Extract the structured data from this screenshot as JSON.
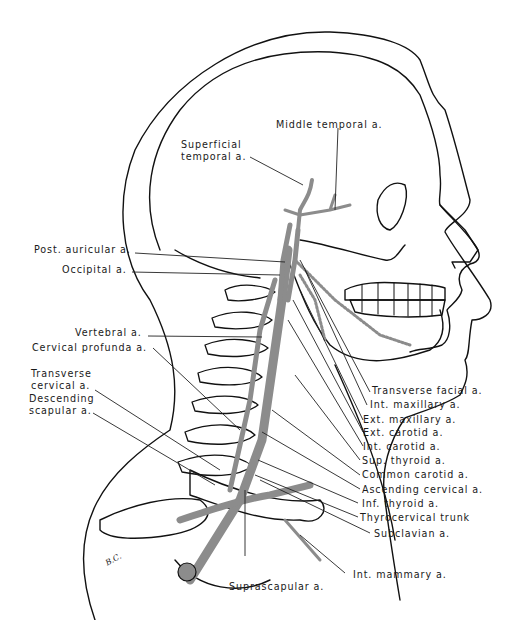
{
  "figure": {
    "artist_initials": "B.C.",
    "colors": {
      "outline": "#111111",
      "artery": "#8c8c8c",
      "leader_line": "#222222",
      "background": "#ffffff"
    }
  },
  "labels": {
    "middle_temporal": "Middle temporal a.",
    "superficial_temporal_1": "Superficial",
    "superficial_temporal_2": "temporal a.",
    "post_auricular": "Post. auricular a.",
    "occipital": "Occipital a.",
    "vertebral": "Vertebral a.",
    "cervical_profunda": "Cervical profunda a.",
    "transverse_cervical_1": "Transverse",
    "transverse_cervical_2": "cervical a.",
    "descending_scapular_1": "Descending",
    "descending_scapular_2": "scapular a.",
    "transverse_facial": "Transverse facial a.",
    "int_maxillary": "Int. maxillary a.",
    "ext_maxillary": "Ext. maxillary a.",
    "ext_carotid": "Ext. carotid a.",
    "int_carotid": "Int. carotid a.",
    "sup_thyroid": "Sup. thyroid a.",
    "common_carotid": "Common carotid a.",
    "ascending_cervical": "Ascending cervical a.",
    "inf_thyroid": "Inf. thyroid a.",
    "thyrocervical_trunk": "Thyrocervical trunk",
    "subclavian": "Subclavian a.",
    "int_mammary": "Int. mammary a.",
    "suprascapular": "Suprascapular a."
  }
}
